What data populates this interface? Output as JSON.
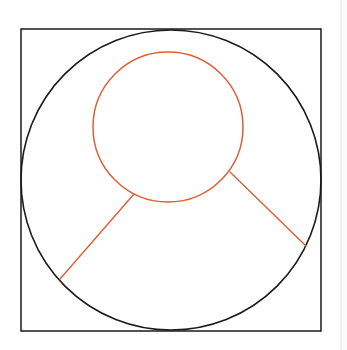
{
  "diagram": {
    "colors": {
      "background": "#ffffff",
      "outline": "#1a1a1a",
      "accent": "#dd5f36",
      "page_edge": "#f1f1f1"
    },
    "square": {
      "x": 21,
      "y": 29,
      "width": 300,
      "height": 302,
      "stroke": "#1a1a1a",
      "stroke_width": 1.5
    },
    "outer_circle": {
      "cx": 171,
      "cy": 180,
      "r": 150,
      "stroke": "#1a1a1a",
      "stroke_width": 1.6
    },
    "inner_circle": {
      "cx": 168,
      "cy": 127,
      "r": 75,
      "stroke": "#dd5f36",
      "stroke_width": 1.5
    },
    "lines": [
      {
        "name": "left-spoke",
        "x1": 134,
        "y1": 194,
        "x2": 60,
        "y2": 279,
        "stroke": "#dd5f36",
        "stroke_width": 1.4
      },
      {
        "name": "right-spoke",
        "x1": 230,
        "y1": 172,
        "x2": 306,
        "y2": 246,
        "stroke": "#dd5f36",
        "stroke_width": 1.4
      }
    ]
  }
}
